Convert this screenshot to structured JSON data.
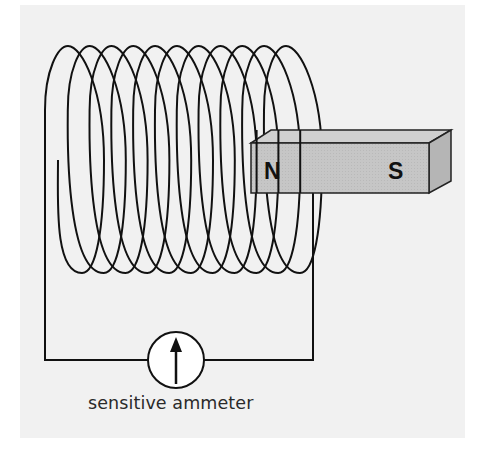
{
  "figure": {
    "caption": "sensitive ammeter",
    "background_color": "#f1f1f1",
    "wire_color": "#111111"
  },
  "coil": {
    "turns": 11,
    "label": "coil-of-wire"
  },
  "magnet": {
    "north_label": "N",
    "south_label": "S",
    "fill_front": "#c4c4c4",
    "fill_top": "#d2d2d2",
    "fill_side": "#b3b3b3"
  },
  "ammeter": {
    "label": "sensitive ammeter",
    "needle": "up-arrow-icon"
  }
}
